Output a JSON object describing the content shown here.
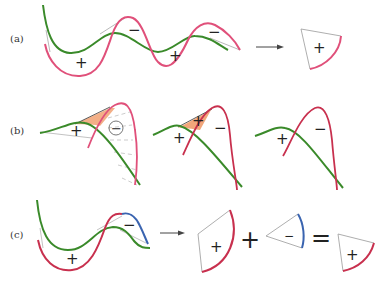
{
  "colors": {
    "pink": "#e0507a",
    "crimson": "#c8304e",
    "green": "#3a8a2a",
    "blue": "#3a64b0",
    "orange_fill": "#f2a67a",
    "gray_line": "#999999"
  },
  "rows": [
    {
      "label": "(a)",
      "signs": [
        "+",
        "−",
        "+",
        "−"
      ],
      "result_sign": "+"
    },
    {
      "label": "(b)",
      "panel1_signs": [
        "+",
        "−"
      ],
      "panel2_signs": [
        "+",
        "+",
        "−"
      ],
      "panel3_signs": [
        "+",
        "−"
      ]
    },
    {
      "label": "(c)",
      "signs": [
        "+",
        "−"
      ],
      "equation": {
        "term1_sign": "+",
        "plus_op": "+",
        "term2_sign": "−",
        "equals_op": "=",
        "result_sign": "+"
      }
    }
  ]
}
